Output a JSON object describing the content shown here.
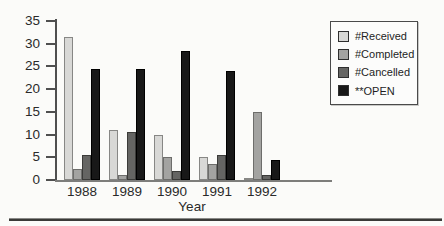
{
  "figure": {
    "background_color": "#fbfbf9",
    "bottom_rule_color": "#3a3a38"
  },
  "chart_data": {
    "type": "bar",
    "title": "",
    "xlabel": "Year",
    "ylabel": "",
    "ylim": [
      0,
      35
    ],
    "yticks": [
      0,
      5,
      10,
      15,
      20,
      25,
      30,
      35
    ],
    "grid": false,
    "legend_position": "top-right",
    "categories": [
      "1988",
      "1989",
      "1990",
      "1991",
      "1992"
    ],
    "series": [
      {
        "name": "#Received",
        "color": "#d8d8d6",
        "border": "#878785",
        "values": [
          31.5,
          11,
          10,
          5,
          0.5
        ]
      },
      {
        "name": "#Completed",
        "color": "#a3a3a1",
        "border": "#6d6d6b",
        "values": [
          2.5,
          1,
          5,
          3.5,
          15
        ]
      },
      {
        "name": "#Cancelled",
        "color": "#656563",
        "border": "#3b3b39",
        "values": [
          5.5,
          10.5,
          2,
          5.5,
          1
        ]
      },
      {
        "name": "**OPEN",
        "color": "#181818",
        "border": "#000000",
        "values": [
          24.5,
          24.5,
          28.5,
          24,
          4.5
        ]
      }
    ]
  }
}
